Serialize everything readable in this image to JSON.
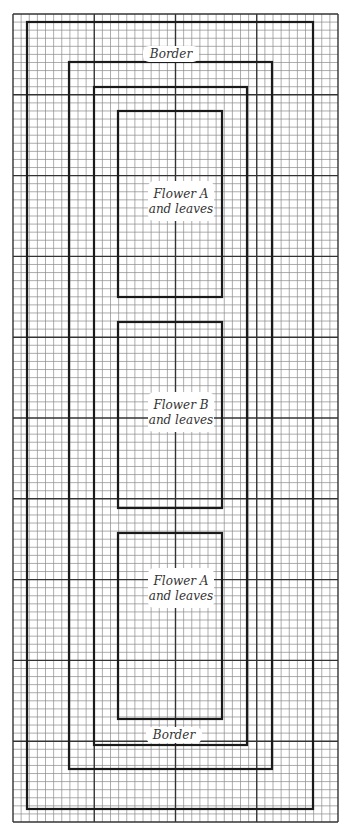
{
  "diagram": {
    "type": "needlework-chart-grid",
    "grid": {
      "x0": 13,
      "y0": 14,
      "x1": 338,
      "y1": 822,
      "columns": 40,
      "rows": 100,
      "major_every": 10,
      "minor_color": "#8a8a8a",
      "major_color": "#333333"
    },
    "rectangles": [
      {
        "name": "outer-border-frame",
        "x0": 27,
        "y0": 22,
        "x1": 313,
        "y1": 809
      },
      {
        "name": "border-band-outer",
        "x0": 69,
        "y0": 62,
        "x1": 272,
        "y1": 769
      },
      {
        "name": "border-band-inner",
        "x0": 94,
        "y0": 87,
        "x1": 247,
        "y1": 745
      },
      {
        "name": "panel-flower-a-top",
        "x0": 118,
        "y0": 111,
        "x1": 222,
        "y1": 297
      },
      {
        "name": "panel-flower-b",
        "x0": 118,
        "y0": 322,
        "x1": 222,
        "y1": 508
      },
      {
        "name": "panel-flower-a-bottom",
        "x0": 118,
        "y0": 533,
        "x1": 222,
        "y1": 719
      }
    ],
    "labels": [
      {
        "name": "label-border-top",
        "lines": [
          "Border"
        ],
        "cx": 171,
        "cy": 54,
        "w": 56,
        "h": 16
      },
      {
        "name": "label-flower-a-top",
        "lines": [
          "Flower A",
          "and leaves"
        ],
        "cx": 181,
        "cy": 201,
        "w": 66,
        "h": 40
      },
      {
        "name": "label-flower-b",
        "lines": [
          "Flower B",
          "and leaves"
        ],
        "cx": 181,
        "cy": 412,
        "w": 66,
        "h": 40
      },
      {
        "name": "label-flower-a-bottom",
        "lines": [
          "Flower A",
          "and leaves"
        ],
        "cx": 181,
        "cy": 588,
        "w": 66,
        "h": 40
      },
      {
        "name": "label-border-bottom",
        "lines": [
          "Border"
        ],
        "cx": 174,
        "cy": 735,
        "w": 56,
        "h": 16
      }
    ],
    "line_color": "#1a1a1a"
  }
}
